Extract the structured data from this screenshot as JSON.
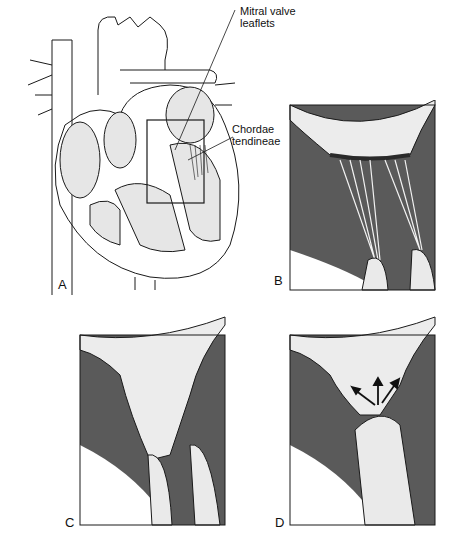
{
  "figure": {
    "panels": [
      {
        "id": "A",
        "label": "A",
        "description": "Heart cross-section with boxed mitral valve region"
      },
      {
        "id": "B",
        "label": "B",
        "description": "Close-up: mitral leaflets and chordae tendineae"
      },
      {
        "id": "C",
        "label": "C",
        "description": "Close-up: leaflets with papillary muscles"
      },
      {
        "id": "D",
        "label": "D",
        "description": "Close-up: prolapsing leaflets with regurgitation arrows"
      }
    ],
    "callouts": [
      {
        "line1": "Mitral valve",
        "line2": "leaflets"
      },
      {
        "line1": "Chordae",
        "line2": "tendineae"
      }
    ]
  },
  "colors": {
    "myocardium": "#5a5a5a",
    "tissue_light": "#e8e8e8",
    "line": "#1a1a1a",
    "background": "#ffffff"
  }
}
